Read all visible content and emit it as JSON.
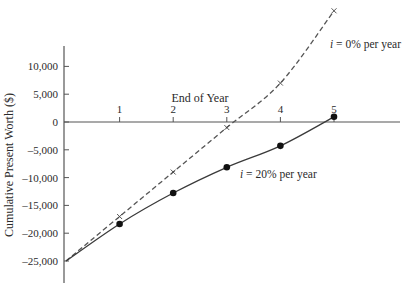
{
  "chart_data": {
    "type": "line",
    "title": "",
    "xlabel": "End of Year",
    "ylabel": "Cumulative Present Worth ($)",
    "x": [
      0,
      1,
      2,
      3,
      4,
      5
    ],
    "x_ticks": [
      "1",
      "2",
      "3",
      "4",
      "5"
    ],
    "y_ticks": [
      "10,000",
      "5,000",
      "0",
      "-5,000",
      "-10,000",
      "-15,000",
      "-20,000",
      "-25,000"
    ],
    "y_tick_values": [
      10000,
      5000,
      0,
      -5000,
      -10000,
      -15000,
      -20000,
      -25000
    ],
    "xlim": [
      0,
      5.2
    ],
    "ylim": [
      -29000,
      14000
    ],
    "grid": false,
    "series": [
      {
        "name": "i = 0% per year",
        "label_prefix": "i",
        "label_rest": " = 0% per year",
        "style": "dashed",
        "marker": "cross",
        "values": [
          -25000,
          -17000,
          -9000,
          -1000,
          7000,
          20000
        ]
      },
      {
        "name": "i = 20% per year",
        "label_prefix": "i",
        "label_rest": " = 20% per year",
        "style": "solid",
        "marker": "dot",
        "values": [
          -25000,
          -18333,
          -12778,
          -8148,
          -4290,
          934
        ]
      }
    ]
  }
}
